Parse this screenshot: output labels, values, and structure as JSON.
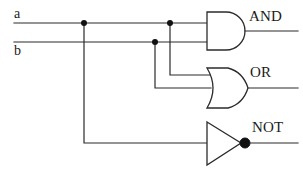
{
  "diagram": {
    "type": "logic-circuit-schematic",
    "background_color": "#ffffff",
    "line_color": "#2b2b2b",
    "inputs": [
      {
        "id": "a",
        "label": "a",
        "wire_y": 23
      },
      {
        "id": "b",
        "label": "b",
        "wire_y": 42
      }
    ],
    "gates": [
      {
        "id": "and",
        "label": "AND",
        "shape": "and-gate",
        "inputs": [
          "a",
          "b"
        ],
        "x": 207,
        "y": 12,
        "width": 38,
        "height": 38
      },
      {
        "id": "or",
        "label": "OR",
        "shape": "or-gate",
        "inputs": [
          "a",
          "b"
        ],
        "x": 207,
        "y": 68,
        "width": 38,
        "height": 40
      },
      {
        "id": "not",
        "label": "NOT",
        "shape": "not-gate-inverter",
        "inputs": [
          "a"
        ],
        "x": 207,
        "y": 122,
        "width": 36,
        "height": 43,
        "has_bubble": true
      }
    ],
    "junctions": [
      {
        "id": "a-to-not",
        "on": "a",
        "x": 84,
        "y": 23
      },
      {
        "id": "b-to-or",
        "on": "b",
        "x": 155,
        "y": 42
      },
      {
        "id": "a-to-or",
        "on": "a",
        "x": 170,
        "y": 23
      }
    ],
    "icons": {
      "junction_dot": "junction-dot-icon",
      "inversion_bubble": "inversion-bubble-icon"
    }
  }
}
